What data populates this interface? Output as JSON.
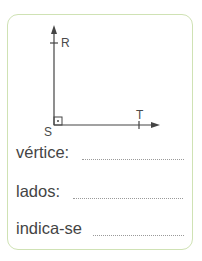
{
  "diagram": {
    "type": "right-angle",
    "points": {
      "vertex": "S",
      "upper": "R",
      "right": "T"
    },
    "colors": {
      "border": "#cfe2b4",
      "line": "#444444",
      "text": "#444444"
    }
  },
  "fields": [
    {
      "label": "vértice:",
      "value": ""
    },
    {
      "label": "lados:",
      "value": ""
    },
    {
      "label": "indica-se",
      "value": ""
    }
  ]
}
